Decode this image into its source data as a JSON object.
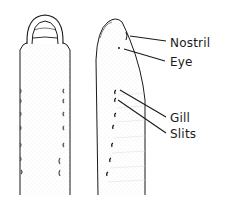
{
  "diagram": {
    "views": [
      {
        "name": "dorsal-view"
      },
      {
        "name": "lateral-view"
      }
    ],
    "labels": [
      {
        "id": "nostril",
        "text": "Nostril"
      },
      {
        "id": "eye",
        "text": "Eye"
      },
      {
        "id": "gill",
        "text": "Gill"
      },
      {
        "id": "slits",
        "text": "Slits"
      }
    ],
    "colors": {
      "ink": "#1a1a1a",
      "stipple": "#9a9a9a",
      "background": "#ffffff"
    }
  }
}
